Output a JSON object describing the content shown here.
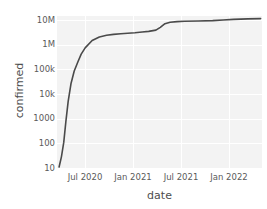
{
  "chart_data": {
    "type": "line",
    "title": "",
    "xlabel": "date",
    "ylabel": "confirmed",
    "yscale": "log",
    "ylim": [
      10,
      10000000
    ],
    "xlim": [
      "2020-02-01",
      "2022-07-01"
    ],
    "grid": true,
    "legend": null,
    "legend_position": "none",
    "line_color": "#4a4a4a",
    "plot_background": "#f3f3f3",
    "grid_color": "#ffffff",
    "ytick_labels": [
      "10M",
      "1M",
      "100k",
      "10k",
      "1000",
      "100",
      "10"
    ],
    "ytick_values": [
      10000000,
      1000000,
      100000,
      10000,
      1000,
      100,
      10
    ],
    "xtick_labels": [
      "Jul 2020",
      "Jan 2021",
      "Jul 2021",
      "Jan 2022"
    ],
    "xtick_values": [
      "2020-07-01",
      "2021-01-01",
      "2021-07-01",
      "2022-01-01"
    ],
    "series": [
      {
        "name": "confirmed",
        "x": [
          "2020-02-10",
          "2020-02-20",
          "2020-03-01",
          "2020-03-10",
          "2020-03-20",
          "2020-04-01",
          "2020-04-15",
          "2020-05-01",
          "2020-05-15",
          "2020-06-01",
          "2020-07-01",
          "2020-08-01",
          "2020-09-01",
          "2020-10-01",
          "2020-11-01",
          "2020-12-01",
          "2021-01-01",
          "2021-02-01",
          "2021-03-01",
          "2021-04-01",
          "2021-04-20",
          "2021-05-10",
          "2021-06-01",
          "2021-07-01",
          "2021-08-01",
          "2021-10-01",
          "2021-12-01",
          "2022-01-15",
          "2022-03-01",
          "2022-05-01",
          "2022-06-25"
        ],
        "y": [
          12,
          30,
          110,
          700,
          4500,
          22000,
          70000,
          160000,
          320000,
          560000,
          1100000,
          1500000,
          1750000,
          1900000,
          2000000,
          2100000,
          2200000,
          2350000,
          2500000,
          2800000,
          3600000,
          5000000,
          5700000,
          6000000,
          6200000,
          6400000,
          6600000,
          7000000,
          7400000,
          7700000,
          7900000
        ]
      }
    ]
  }
}
